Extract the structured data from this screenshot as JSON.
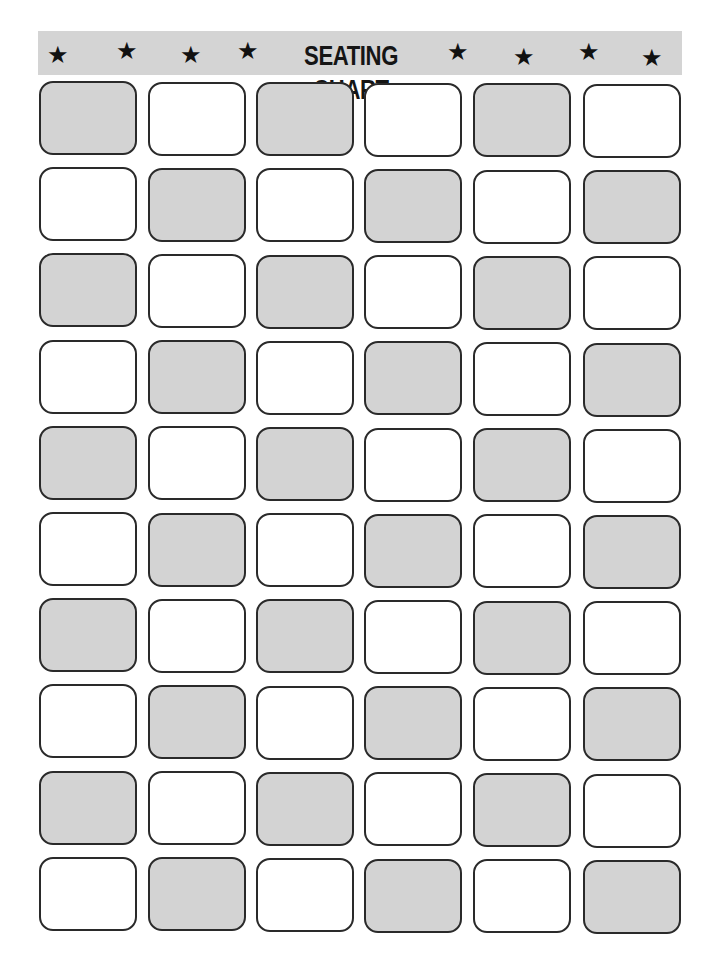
{
  "banner": {
    "title": "SEATING CHART",
    "star_glyph": "★",
    "background": "#d4d4d4",
    "stars_left": 4,
    "stars_right": 4
  },
  "grid": {
    "rows": 10,
    "columns": 6,
    "pattern": "checkerboard",
    "shaded_color": "#d3d3d3",
    "unshaded_color": "#ffffff",
    "first_cell_shaded": true
  }
}
